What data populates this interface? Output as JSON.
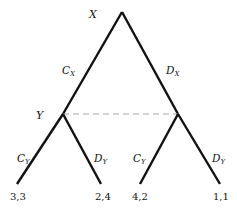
{
  "diagram": {
    "type": "extensive-form game tree",
    "nodes": {
      "root": {
        "label": "X",
        "x": 122,
        "y": 12
      },
      "left": {
        "label": "Y",
        "x": 63,
        "y": 114
      },
      "right": {
        "label": "",
        "x": 178,
        "y": 114
      }
    },
    "root_actions": {
      "left": {
        "main": "C",
        "sub": "X"
      },
      "right": {
        "main": "D",
        "sub": "X"
      }
    },
    "y_actions": {
      "left_subtree_left": {
        "main": "C",
        "sub": "Y"
      },
      "left_subtree_right": {
        "main": "D",
        "sub": "Y"
      },
      "right_subtree_left": {
        "main": "C",
        "sub": "Y"
      },
      "right_subtree_right": {
        "main": "D",
        "sub": "Y"
      }
    },
    "payoffs": [
      "3,3",
      "2,4",
      "4,2",
      "1,1"
    ],
    "information_set": "dashed line joining Y's two decision nodes",
    "colors": {
      "branch": "#111111",
      "info_set": "#a8a8a8",
      "background": "#ffffff"
    }
  }
}
